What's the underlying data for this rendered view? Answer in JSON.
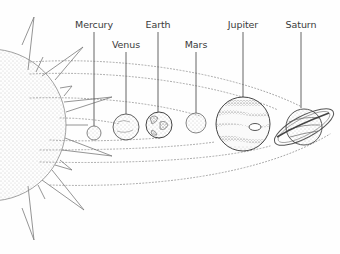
{
  "diagram": {
    "type": "solar-system-illustration",
    "style": "black-and-white stippled line art",
    "sun": {
      "label": null,
      "position": "left edge, partially cropped"
    },
    "planets": [
      {
        "name": "Mercury",
        "cx": 94,
        "cy": 133,
        "r": 7,
        "label_x": 94,
        "label_y": 19
      },
      {
        "name": "Venus",
        "cx": 126,
        "cy": 127,
        "r": 13,
        "label_x": 126,
        "label_y": 39
      },
      {
        "name": "Earth",
        "cx": 159,
        "cy": 125,
        "r": 13,
        "label_x": 158,
        "label_y": 19
      },
      {
        "name": "Mars",
        "cx": 196,
        "cy": 123,
        "r": 10,
        "label_x": 196,
        "label_y": 39
      },
      {
        "name": "Jupiter",
        "cx": 243,
        "cy": 124,
        "r": 27,
        "label_x": 243,
        "label_y": 19
      },
      {
        "name": "Saturn",
        "cx": 304,
        "cy": 127,
        "r": 20,
        "label_x": 301,
        "label_y": 19
      }
    ],
    "colors": {
      "ink": "#555555",
      "dots": "#9a9a9a",
      "background": "#fefefe"
    }
  }
}
